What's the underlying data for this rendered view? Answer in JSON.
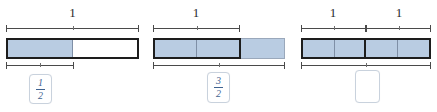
{
  "canvas": {
    "width": 437,
    "height": 112,
    "background": "#ffffff"
  },
  "colors": {
    "fill_blue": "#b9cce2",
    "whole_border": "#1d1d1d",
    "soft_border": "#9aa8bb",
    "cell_divider": "#7f8fa6",
    "brace": "#4a4a4a",
    "label_text": "#2b2b2b",
    "fraction_text": "#3f6390",
    "valbox_border": "#c9d2dd"
  },
  "models": [
    {
      "id": "model-one-half",
      "top_labels": [
        "1"
      ],
      "whole_cells": 2,
      "extra_cells": 0,
      "shaded_cells": 1,
      "bottom_brace_cells": 1,
      "answer": {
        "type": "fraction",
        "numerator": "1",
        "denominator": "2",
        "empty": false
      }
    },
    {
      "id": "model-three-halves",
      "top_labels": [
        "1"
      ],
      "whole_cells": 2,
      "extra_cells": 1,
      "shaded_cells": 3,
      "bottom_brace_cells": 3,
      "answer": {
        "type": "fraction",
        "numerator": "3",
        "denominator": "2",
        "empty": false
      }
    },
    {
      "id": "model-four-halves",
      "top_labels": [
        "1",
        "1"
      ],
      "whole_cells": 4,
      "extra_cells": 0,
      "shaded_cells": 4,
      "bottom_brace_cells": 4,
      "answer": {
        "type": "fraction",
        "numerator": "",
        "denominator": "",
        "empty": true
      }
    }
  ]
}
